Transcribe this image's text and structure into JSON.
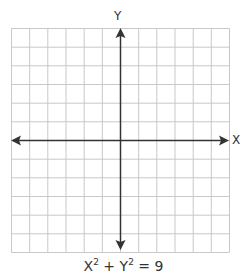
{
  "diagram": {
    "type": "coordinate-plane",
    "axes": {
      "x_label": "X",
      "y_label": "Y"
    },
    "grid": {
      "columns": 12,
      "rows": 12,
      "line_color": "#c8c8c8"
    },
    "axis_color": "#333333",
    "equation": {
      "base1": "X",
      "exp1": "2",
      "op": " + ",
      "base2": "Y",
      "exp2": "2",
      "rhs": " = 9"
    }
  }
}
